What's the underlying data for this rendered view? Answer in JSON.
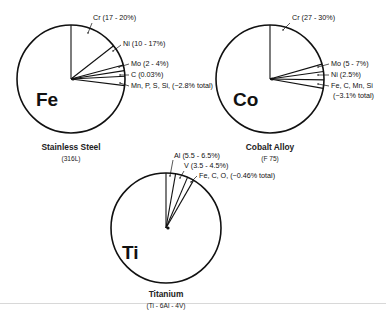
{
  "figure": {
    "rule_color": "#d8d8d8",
    "line_color": "#111111"
  },
  "pies": [
    {
      "id": "stainless-steel",
      "base_element": "Fe",
      "title": "Stainless Steel",
      "subtitle": "(316L)",
      "center": [
        71,
        79
      ],
      "radius": 54,
      "boundary_angles_deg": [
        90,
        38,
        15,
        9,
        3,
        -7
      ],
      "labels": [
        {
          "text": "Cr (17 - 20%)",
          "x": 93,
          "y": 20,
          "tick_from": [
            88,
            33
          ],
          "tick_to": [
            92,
            23
          ]
        },
        {
          "text": "Ni (10 - 17%)",
          "x": 123,
          "y": 46,
          "tick_from": [
            113,
            51
          ],
          "tick_to": [
            121,
            45
          ]
        },
        {
          "text": "Mo (2 - 4%)",
          "x": 131,
          "y": 66,
          "tick_from": [
            119,
            67
          ],
          "tick_to": [
            129,
            64
          ]
        },
        {
          "text": "C (0.03%)",
          "x": 131,
          "y": 77,
          "tick_from": [
            120,
            75
          ],
          "tick_to": [
            129,
            75
          ]
        },
        {
          "text": "Mn, P, S, Si, (~2.8% total)",
          "x": 131,
          "y": 88,
          "tick_from": [
            120,
            83
          ],
          "tick_to": [
            129,
            86
          ]
        }
      ]
    },
    {
      "id": "cobalt-alloy",
      "base_element": "Co",
      "title": "Cobalt Alloy",
      "subtitle": "(F 75)",
      "center": [
        270,
        79
      ],
      "radius": 54,
      "boundary_angles_deg": [
        90,
        16,
        8,
        -1,
        -10
      ],
      "labels": [
        {
          "text": "Cr (27 - 30%)",
          "x": 292,
          "y": 20,
          "tick_from": [
            283,
            30
          ],
          "tick_to": [
            290,
            23
          ]
        },
        {
          "text": "Mo (5 - 7%)",
          "x": 331,
          "y": 66,
          "tick_from": [
            318,
            67
          ],
          "tick_to": [
            329,
            64
          ]
        },
        {
          "text": "Ni (2.5%)",
          "x": 331,
          "y": 77,
          "tick_from": [
            318,
            75
          ],
          "tick_to": [
            329,
            75
          ]
        },
        {
          "text": "Fe, C, Mn, Si",
          "x": 331,
          "y": 88,
          "tick_from": [
            318,
            84
          ],
          "tick_to": [
            329,
            86
          ]
        },
        {
          "text": "(~3.1% total)",
          "x": 333,
          "y": 98,
          "tick_from": null,
          "tick_to": null
        }
      ]
    },
    {
      "id": "titanium",
      "base_element": "Ti",
      "title": "Titanium",
      "subtitle": "(Ti - 6Al - 4V)",
      "center": [
        166,
        228
      ],
      "radius": 55,
      "boundary_angles_deg": [
        90,
        80,
        67,
        60
      ],
      "labels": [
        {
          "text": "Al (5.5 - 6.5%)",
          "x": 174,
          "y": 158,
          "tick_from": [
            170,
            176
          ],
          "tick_to": [
            173,
            160
          ]
        },
        {
          "text": "V (3.5 - 4.5%)",
          "x": 184,
          "y": 168,
          "tick_from": [
            180,
            178
          ],
          "tick_to": [
            184,
            171
          ]
        },
        {
          "text": "Fe, C, O, (~0.46% total)",
          "x": 199,
          "y": 178,
          "tick_from": [
            191,
            182
          ],
          "tick_to": [
            197,
            176
          ]
        }
      ]
    }
  ]
}
